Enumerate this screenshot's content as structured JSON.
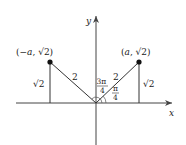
{
  "diagram": {
    "axes": {
      "x_label": "x",
      "y_label": "y"
    },
    "points": [
      {
        "label": "(−a, √2)",
        "x_text": "(−",
        "var": "a",
        "rest": ", √2)"
      },
      {
        "label": "(a, √2)",
        "x_text": "(",
        "var": "a",
        "rest": ", √2)"
      }
    ],
    "segments": {
      "left_hypotenuse": "2",
      "right_hypotenuse": "2",
      "left_height": "√2",
      "right_height": "√2"
    },
    "angles": {
      "obtuse": {
        "num": "3π",
        "den": "4"
      },
      "acute": {
        "num": "π",
        "den": "4"
      }
    },
    "colors": {
      "line": "#333333",
      "point": "#111111",
      "background": "#ffffff"
    }
  }
}
